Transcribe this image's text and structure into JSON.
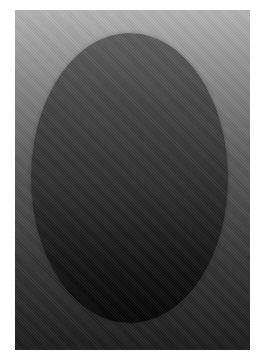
{
  "image": {
    "description": "Vertical rectangle with top-to-bottom gray-to-black gradient containing a centered dark oval",
    "background_color": "#ffffff",
    "panel": {
      "gradient_top": "#b4b4b4",
      "gradient_bottom": "#1c1c1c"
    },
    "oval": {
      "gradient_top": "#5e5e5e",
      "gradient_bottom": "#050505"
    }
  }
}
